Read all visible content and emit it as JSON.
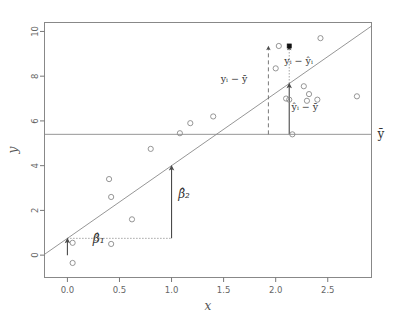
{
  "chart_data": {
    "type": "scatter",
    "title": "",
    "subtitle": "",
    "xlabel": "x",
    "ylabel": "y",
    "xlim": [
      -0.22,
      2.92
    ],
    "ylim": [
      -1.0,
      10.4
    ],
    "xticks": [
      "0.0",
      "0.5",
      "1.0",
      "1.5",
      "2.0",
      "2.5"
    ],
    "xtick_values": [
      0.0,
      0.5,
      1.0,
      1.5,
      2.0,
      2.5
    ],
    "yticks": [
      "0",
      "2",
      "4",
      "6",
      "8",
      "10"
    ],
    "ytick_values": [
      0,
      2,
      4,
      6,
      8,
      10
    ],
    "grid": false,
    "legend": "none",
    "x": [
      0.05,
      0.05,
      0.28,
      0.4,
      0.42,
      0.42,
      0.62,
      0.8,
      1.08,
      1.18,
      1.4,
      2.0,
      2.03,
      2.1,
      2.13,
      2.16,
      2.27,
      2.3,
      2.32,
      2.4,
      2.43,
      2.78
    ],
    "y": [
      0.55,
      -0.35,
      0.75,
      3.4,
      2.6,
      0.5,
      1.6,
      4.75,
      5.45,
      5.9,
      6.2,
      8.35,
      9.35,
      7.0,
      6.95,
      5.4,
      7.55,
      6.9,
      7.2,
      6.95,
      9.7,
      7.1
    ],
    "highlight_point": {
      "x": 2.13,
      "y": 9.35,
      "filled": true
    },
    "regression_line": {
      "intercept": 0.75,
      "slope": 3.25,
      "x_from": -0.22,
      "x_to": 2.92,
      "label": "fitted regression line"
    },
    "mean_line": {
      "y": 5.4,
      "label": "y-bar",
      "label_text": "ȳ"
    },
    "annotations": [
      {
        "id": "beta1",
        "text": "β̂1",
        "math": "β̂₁",
        "x": 0.3,
        "y": 0.55,
        "describes": "intercept arrow from y=0 to regression line at x=0"
      },
      {
        "id": "beta2",
        "text": "β̂2",
        "math": "β̂₂",
        "x": 1.12,
        "y": 2.55,
        "describes": "slope arrow rise over run 1 unit"
      },
      {
        "id": "total-dev",
        "text": "yi - ȳ",
        "math": "yᵢ − ȳ",
        "x": 1.6,
        "y": 7.75,
        "describes": "total deviation of observation from mean"
      },
      {
        "id": "residual",
        "text": "yi - ŷi",
        "math": "yᵢ − ŷᵢ",
        "x": 2.22,
        "y": 8.55,
        "describes": "residual between observation and fitted value"
      },
      {
        "id": "explained-dev",
        "text": "ŷi - ȳ",
        "math": "ŷᵢ − ȳ",
        "x": 2.28,
        "y": 6.5,
        "describes": "explained deviation of fitted value from mean"
      }
    ],
    "guides": {
      "beta1_arrow": {
        "x": 0.0,
        "y_from": 0.0,
        "y_to": 0.75
      },
      "beta2_arrow": {
        "x": 1.0,
        "y_from": 0.75,
        "y_to": 4.0
      },
      "beta2_run": {
        "y": 0.75,
        "x_from": 0.0,
        "x_to": 1.0
      },
      "total_dev_dashed": {
        "x": 1.93,
        "y_from": 5.4,
        "y_to": 9.35
      },
      "residual_dotted": {
        "x": 2.13,
        "y_from": 7.68,
        "y_to": 9.35
      },
      "explained_arrow": {
        "x": 2.13,
        "y_from": 5.4,
        "y_to": 7.68
      }
    },
    "colors": {
      "point_stroke": "#8a8a8a",
      "line": "#8a8a8a",
      "arrow": "#4a4a4a",
      "text": "#333333",
      "axis": "#777777",
      "background": "#ffffff"
    }
  }
}
